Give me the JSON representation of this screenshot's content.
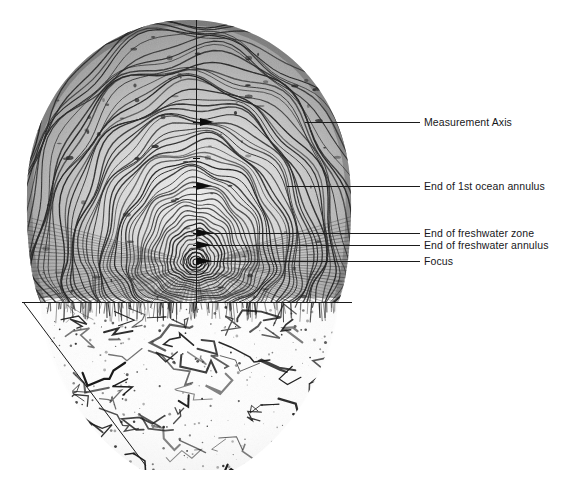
{
  "figure": {
    "type": "annotated-specimen-photograph",
    "caption": "",
    "background_color": "#ffffff",
    "line_color": "#1a1a1a",
    "width_px": 564,
    "height_px": 489
  },
  "specimen": {
    "name": "fish-scale",
    "description": "Fish scale showing concentric circuli and annuli growth rings",
    "focus_x_px": 196,
    "focus_y_px": 262
  },
  "axes": {
    "measurement_axis": {
      "name": "measurement-axis",
      "orientation": "vertical",
      "x_px": 196,
      "y_start_px": 20,
      "y_end_px": 305
    },
    "baseline": {
      "name": "scale-baseline",
      "orientation": "horizontal",
      "y_px": 302,
      "x_start_px": 22,
      "x_end_px": 352
    },
    "diagonal": {
      "name": "scale-radius-diagonal",
      "x_start_px": 24,
      "y_start_px": 303,
      "x_end_px": 146,
      "y_end_px": 466
    }
  },
  "annotations": [
    {
      "id": "measurement-axis",
      "label": "Measurement Axis",
      "leader_y_px": 122,
      "leader_x_start_px": 305,
      "leader_x_end_px": 420,
      "text_x_px": 424,
      "text_y_px": 116
    },
    {
      "id": "end-of-1st-ocean-annulus",
      "label": "End of 1st ocean annulus",
      "leader_y_px": 186,
      "leader_x_start_px": 287,
      "leader_x_end_px": 420,
      "text_x_px": 424,
      "text_y_px": 180
    },
    {
      "id": "end-of-freshwater-zone",
      "label": "End of freshwater zone",
      "leader_y_px": 233,
      "leader_x_start_px": 205,
      "leader_x_end_px": 420,
      "text_x_px": 424,
      "text_y_px": 227
    },
    {
      "id": "end-of-freshwater-annulus",
      "label": "End of freshwater annulus",
      "leader_y_px": 245,
      "leader_x_start_px": 207,
      "leader_x_end_px": 420,
      "text_x_px": 424,
      "text_y_px": 239
    },
    {
      "id": "focus",
      "label": "Focus",
      "leader_y_px": 261,
      "leader_x_start_px": 200,
      "leader_x_end_px": 420,
      "text_x_px": 424,
      "text_y_px": 255
    }
  ],
  "axis_ticks": [
    {
      "y_px": 122
    },
    {
      "y_px": 158
    },
    {
      "y_px": 186
    },
    {
      "y_px": 233
    },
    {
      "y_px": 245
    }
  ]
}
